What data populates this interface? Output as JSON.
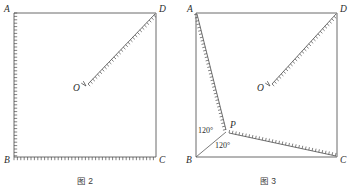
{
  "page": {
    "width": 356,
    "height": 190,
    "background": "#ffffff",
    "ink_color": "#4a4a4a"
  },
  "figures": [
    {
      "id": "fig2",
      "caption": "图 2",
      "vertices": [
        {
          "name": "A",
          "label": "A",
          "x": 14,
          "y": 13,
          "label_x": 4,
          "label_y": 12
        },
        {
          "name": "D",
          "label": "D",
          "x": 156,
          "y": 13,
          "label_x": 159,
          "label_y": 12
        },
        {
          "name": "B",
          "label": "B",
          "x": 14,
          "y": 157,
          "label_x": 4,
          "label_y": 163
        },
        {
          "name": "C",
          "label": "C",
          "x": 156,
          "y": 157,
          "label_x": 159,
          "label_y": 163
        },
        {
          "name": "O",
          "label": "O",
          "x": 84,
          "y": 88,
          "label_x": 73,
          "label_y": 91
        }
      ],
      "plain_edges": [
        {
          "name": "edge-AD",
          "from": "A",
          "to": "D"
        },
        {
          "name": "edge-DC",
          "from": "D",
          "to": "C"
        }
      ],
      "hatched_edges": [
        {
          "name": "edge-AB",
          "x1": 14,
          "y1": 13,
          "x2": 14,
          "y2": 157,
          "tick_side": -1,
          "tick_len": 3.2,
          "spacing": 3.4
        },
        {
          "name": "edge-BC",
          "x1": 14,
          "y1": 157,
          "x2": 156,
          "y2": 157,
          "tick_side": 1,
          "tick_len": 3.2,
          "spacing": 3.4
        },
        {
          "name": "segment-OD",
          "x1": 88,
          "y1": 84,
          "x2": 155,
          "y2": 14,
          "tick_side": 1,
          "tick_len": 3.0,
          "spacing": 3.4
        }
      ],
      "arrows": [
        {
          "name": "arrow-toward-O",
          "tip_x": 86,
          "tip_y": 86,
          "angle_deg": 226,
          "length": 5.5,
          "spread_deg": 15
        }
      ],
      "angle_labels": [],
      "caption_x": 85,
      "caption_y": 184
    },
    {
      "id": "fig3",
      "caption": "图 3",
      "vertices": [
        {
          "name": "A",
          "label": "A",
          "x": 196,
          "y": 13,
          "label_x": 187,
          "label_y": 12
        },
        {
          "name": "D",
          "label": "D",
          "x": 337,
          "y": 13,
          "label_x": 340,
          "label_y": 12
        },
        {
          "name": "B",
          "label": "B",
          "x": 196,
          "y": 157,
          "label_x": 186,
          "label_y": 163
        },
        {
          "name": "C",
          "label": "C",
          "x": 337,
          "y": 157,
          "label_x": 340,
          "label_y": 163
        },
        {
          "name": "P",
          "label": "P",
          "x": 227,
          "y": 131,
          "label_x": 230,
          "label_y": 128
        },
        {
          "name": "O",
          "label": "O",
          "x": 268,
          "y": 88,
          "label_x": 257,
          "label_y": 91
        }
      ],
      "plain_edges": [
        {
          "name": "edge-AD",
          "from": "A",
          "to": "D"
        },
        {
          "name": "edge-DC",
          "from": "D",
          "to": "C"
        },
        {
          "name": "edge-AB",
          "from": "A",
          "to": "B"
        },
        {
          "name": "edge-BC",
          "from": "B",
          "to": "C"
        }
      ],
      "plain_segments": [
        {
          "name": "segment-BP",
          "x1": 196,
          "y1": 157,
          "x2": 226,
          "y2": 132
        }
      ],
      "hatched_edges": [
        {
          "name": "segment-AP",
          "x1": 197,
          "y1": 14,
          "x2": 226,
          "y2": 130,
          "tick_side": 1,
          "tick_len": 3.0,
          "spacing": 3.4
        },
        {
          "name": "segment-PC",
          "x1": 229,
          "y1": 133,
          "x2": 336,
          "y2": 156,
          "tick_side": -1,
          "tick_len": 3.0,
          "spacing": 3.4
        },
        {
          "name": "segment-OD",
          "x1": 272,
          "y1": 84,
          "x2": 336,
          "y2": 14,
          "tick_side": 1,
          "tick_len": 3.0,
          "spacing": 3.4
        }
      ],
      "arrows": [
        {
          "name": "arrow-toward-O",
          "tip_x": 270,
          "tip_y": 86,
          "angle_deg": 226,
          "length": 5.5,
          "spread_deg": 15
        }
      ],
      "angle_labels": [
        {
          "name": "angle-APB-label",
          "text": "120°",
          "x": 198,
          "y": 133
        },
        {
          "name": "angle-BPC-label",
          "text": "120°",
          "x": 215,
          "y": 148
        }
      ],
      "caption_x": 268,
      "caption_y": 184
    }
  ],
  "chart_data": {
    "type": "diagram",
    "figure_2": {
      "shape": "square ABCD",
      "corner_labels": [
        "A",
        "D",
        "B",
        "C"
      ],
      "interior_point": "O",
      "hatched_segments": [
        "AB",
        "BC",
        "OD"
      ],
      "plain_segments": [
        "AD",
        "DC"
      ],
      "annotations": []
    },
    "figure_3": {
      "shape": "square ABCD",
      "corner_labels": [
        "A",
        "D",
        "B",
        "C"
      ],
      "interior_points": [
        "P",
        "O"
      ],
      "hatched_segments": [
        "AP",
        "PC",
        "OD"
      ],
      "plain_segments": [
        "AD",
        "DC",
        "AB",
        "BC",
        "BP"
      ],
      "annotations": [
        "120°",
        "120°"
      ]
    }
  }
}
